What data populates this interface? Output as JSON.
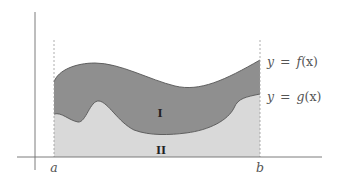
{
  "diagram": {
    "curves": {
      "f": {
        "label_y": "y",
        "label_eq": "=",
        "label_fn": "f",
        "label_arg": "(x)",
        "full_label": "y = f(x)"
      },
      "g": {
        "label_y": "y",
        "label_eq": "=",
        "label_fn": "g",
        "label_arg": "(x)",
        "full_label": "y = g(x)"
      }
    },
    "regions": {
      "upper": {
        "label": "I",
        "color": "#8f8f8f"
      },
      "lower": {
        "label": "II",
        "color": "#d9d9d9"
      }
    },
    "bounds": {
      "a": "a",
      "b": "b"
    },
    "colors": {
      "axis": "#6e6e6e",
      "curve_stroke": "#555555",
      "dashed": "#9a9a9a",
      "background": "#ffffff"
    }
  }
}
